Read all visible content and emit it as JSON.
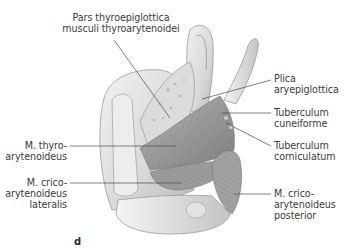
{
  "figure": {
    "panel_letter": "d",
    "labels": {
      "pars_thyroepiglottica": [
        "Pars thyroepiglottica",
        "musculi thyroarytenoidei"
      ],
      "plica_aryepiglottica": [
        "Plica",
        "aryepiglottica"
      ],
      "tuberculum_cuneiforme": [
        "Tuberculum",
        "cuneiforme"
      ],
      "tuberculum_corniculatum": [
        "Tuberculum",
        "corniculatum"
      ],
      "m_thyroarytenoideus": [
        "M. thyro-",
        "arytenoideus"
      ],
      "m_cricoarytenoideus_lateralis": [
        "M. crico-",
        "arytenoideus",
        "lateralis"
      ],
      "m_cricoarytenoideus_posterior": [
        "M. crico-",
        "arytenoideus",
        "posterior"
      ]
    },
    "colors": {
      "text": "#3b3b3b",
      "leader_line": "#4a4a4a",
      "cartilage_light": "#e6e6e6",
      "cartilage_mid": "#c9c9c9",
      "muscle_dark": "#8a8a8a",
      "muscle_mid": "#a8a8a8"
    }
  }
}
